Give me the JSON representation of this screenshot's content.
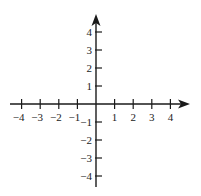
{
  "chart_data": {
    "type": "scatter",
    "title": "",
    "xlabel": "",
    "ylabel": "",
    "xlim": [
      -4,
      4
    ],
    "ylim": [
      -4,
      4
    ],
    "grid": false,
    "x_ticks": [
      -4,
      -3,
      -2,
      -1,
      1,
      2,
      3,
      4
    ],
    "y_ticks": [
      4,
      3,
      2,
      1,
      -1,
      -2,
      -3,
      -4
    ],
    "x_tick_labels": [
      "-4",
      "-3",
      "-2",
      "-1",
      "1",
      "2",
      "3",
      "4"
    ],
    "y_tick_labels": [
      "4",
      "3",
      "2",
      "1",
      "-1",
      "-2",
      "-3",
      "-4"
    ],
    "points": []
  },
  "colors": {
    "axis": "#1a1a1a",
    "text": "#222222"
  }
}
